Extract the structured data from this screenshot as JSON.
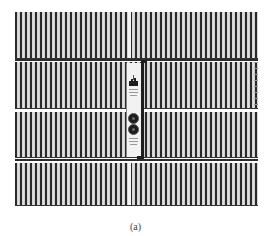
{
  "figure": {
    "caption": "(a)",
    "rows": 4,
    "panel": {
      "icon": "chart-logo-icon",
      "buttons": 2,
      "button_icon": "round-knob-icon"
    },
    "colors": {
      "slot_dark": "#2a2a2a",
      "slot_light": "#e6e6e6",
      "panel_bg": "#f2f2f2",
      "background": "#ffffff"
    }
  }
}
